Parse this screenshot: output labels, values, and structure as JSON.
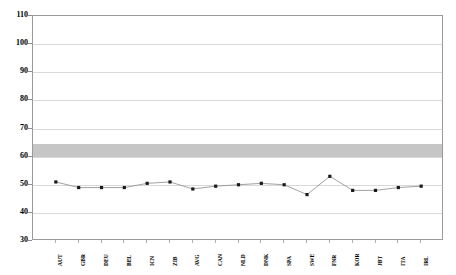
{
  "chart": {
    "title": "",
    "background": "#ffffff",
    "frame_color": "#9a9a9a",
    "band_color": "#c6c6c6",
    "line_color": "#8a8a8a",
    "marker_color": "#1a1a1a"
  },
  "chart_data": {
    "type": "line",
    "title": "",
    "xlabel": "",
    "ylabel": "",
    "ylim": [
      30,
      110
    ],
    "yticks": [
      30,
      40,
      50,
      60,
      70,
      80,
      90,
      100,
      110
    ],
    "grid": true,
    "legend": "none",
    "categories": [
      "AUT",
      "GBR",
      "DEU",
      "BEL",
      "ICN",
      "ZIB",
      "AVG",
      "CAN",
      "NLD",
      "DNK",
      "SPA",
      "SWE",
      "FNR",
      "KOR",
      "JBT",
      "ITA",
      "IRL"
    ],
    "values": [
      51,
      49,
      49,
      49,
      50.5,
      51,
      48.5,
      49.5,
      50,
      50.5,
      50,
      46.5,
      53,
      48,
      48,
      49,
      49.5
    ],
    "reference_band": {
      "label": "",
      "low": 60,
      "high": 64.5
    },
    "series": [
      {
        "name": "",
        "values": [
          51,
          49,
          49,
          49,
          50.5,
          51,
          48.5,
          49.5,
          50,
          50.5,
          50,
          46.5,
          53,
          48,
          48,
          49,
          49.5
        ]
      }
    ]
  }
}
